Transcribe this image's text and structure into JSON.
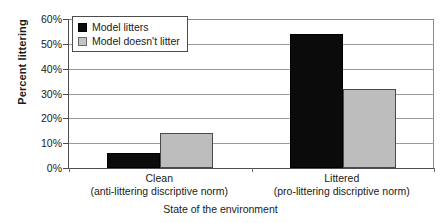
{
  "chart_data": {
    "type": "bar",
    "title": "",
    "xlabel": "State of the environment",
    "ylabel": "Percent littering",
    "categories": [
      "Clean",
      "Littered"
    ],
    "category_sublabels": [
      "(anti-littering discriptive norm)",
      "(pro-littering discriptive norm)"
    ],
    "series": [
      {
        "name": "Model litters",
        "values": [
          6,
          54
        ],
        "color": "#0b0b0b"
      },
      {
        "name": "Model doesn't litter",
        "values": [
          14,
          32
        ],
        "color": "#bdbdbd"
      }
    ],
    "ylim": [
      0,
      60
    ],
    "ytick_values": [
      0,
      10,
      20,
      30,
      40,
      50,
      60
    ],
    "ytick_labels": [
      "0%",
      "10%",
      "20%",
      "30%",
      "40%",
      "50%",
      "60%"
    ],
    "grid": true,
    "legend_position": "top-left"
  },
  "legend": {
    "items": [
      {
        "label": "Model litters",
        "swatch": "black-square-icon"
      },
      {
        "label": "Model doesn't litter",
        "swatch": "gray-square-icon"
      }
    ]
  }
}
